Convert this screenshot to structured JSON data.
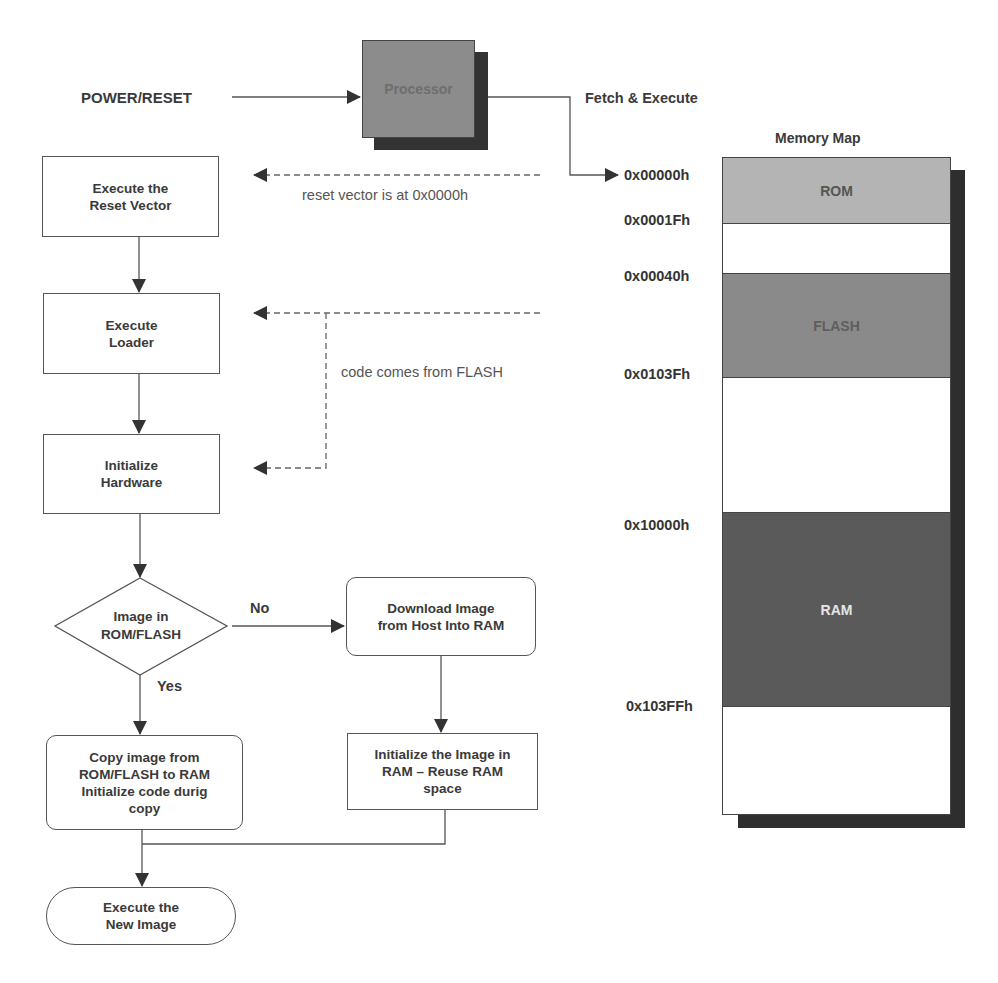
{
  "diagram": {
    "type": "boot-sequence-flowchart",
    "power_reset_label": "POWER/RESET",
    "processor_label": "Processor",
    "fetch_execute_label": "Fetch & Execute",
    "annotations": {
      "reset_vector": "reset vector is at 0x0000h",
      "code_from_flash": "code comes from FLASH"
    },
    "flow": {
      "reset_vector_box": "Execute the\nReset Vector",
      "loader_box": "Execute\nLoader",
      "init_hw_box": "Initialize\nHardware",
      "decision": "Image in\nROM/FLASH",
      "no_label": "No",
      "yes_label": "Yes",
      "download_box": "Download Image\nfrom Host Into RAM",
      "init_image_box": "Initialize the Image in\nRAM – Reuse RAM\nspace",
      "copy_box": "Copy image from\nROM/FLASH to RAM\nInitialize code durig\ncopy",
      "execute_new_box": "Execute the\nNew Image"
    },
    "memory_map": {
      "title": "Memory Map",
      "regions": [
        {
          "name": "ROM",
          "start": "0x00000h",
          "end": "0x0001Fh",
          "color": "#b4b4b4"
        },
        {
          "name": "",
          "color": "#ffffff"
        },
        {
          "name": "FLASH",
          "start": "0x00040h",
          "end": "0x0103Fh",
          "color": "#8a8a8a"
        },
        {
          "name": "",
          "color": "#ffffff"
        },
        {
          "name": "RAM",
          "start": "0x10000h",
          "end": "0x103FFh",
          "color": "#5a5a5a"
        },
        {
          "name": "",
          "color": "#ffffff"
        }
      ],
      "addresses": [
        "0x00000h",
        "0x0001Fh",
        "0x00040h",
        "0x0103Fh",
        "0x10000h",
        "0x103FFh"
      ]
    }
  }
}
